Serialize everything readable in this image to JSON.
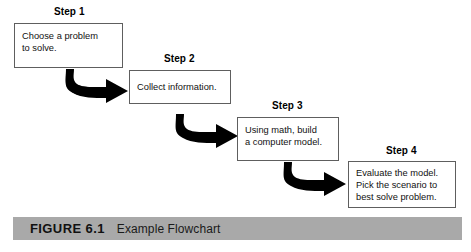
{
  "figure": {
    "caption_number": "FIGURE 6.1",
    "caption_title": "Example Flowchart",
    "caption_bar_color": "#a9a9a9",
    "background_color": "#ffffff"
  },
  "flowchart": {
    "box_border_color": "#5e5e5e",
    "arrow_color": "#000000",
    "steps": [
      {
        "label": "Step 1",
        "text": "Choose a problem\nto solve."
      },
      {
        "label": "Step 2",
        "text": "Collect information."
      },
      {
        "label": "Step 3",
        "text": "Using math, build\na computer model."
      },
      {
        "label": "Step 4",
        "text": "Evaluate the model.\nPick the scenario to\nbest solve problem."
      }
    ],
    "connectors": [
      {
        "name": "curved-arrow-step1-to-step2"
      },
      {
        "name": "curved-arrow-step2-to-step3"
      },
      {
        "name": "curved-arrow-step3-to-step4"
      }
    ]
  }
}
